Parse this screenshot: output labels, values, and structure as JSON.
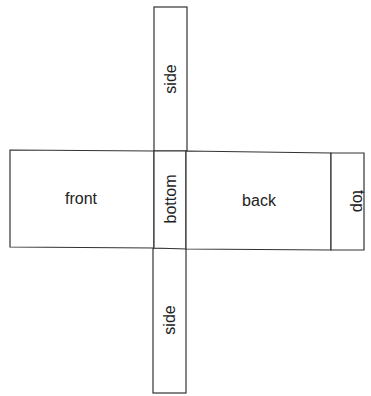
{
  "diagram": {
    "panels": {
      "side_top": "side",
      "front": "front",
      "bottom": "bottom",
      "back": "back",
      "top": "top",
      "side_bottom": "side"
    },
    "line_color": "#333333",
    "text_color": "#222222"
  }
}
